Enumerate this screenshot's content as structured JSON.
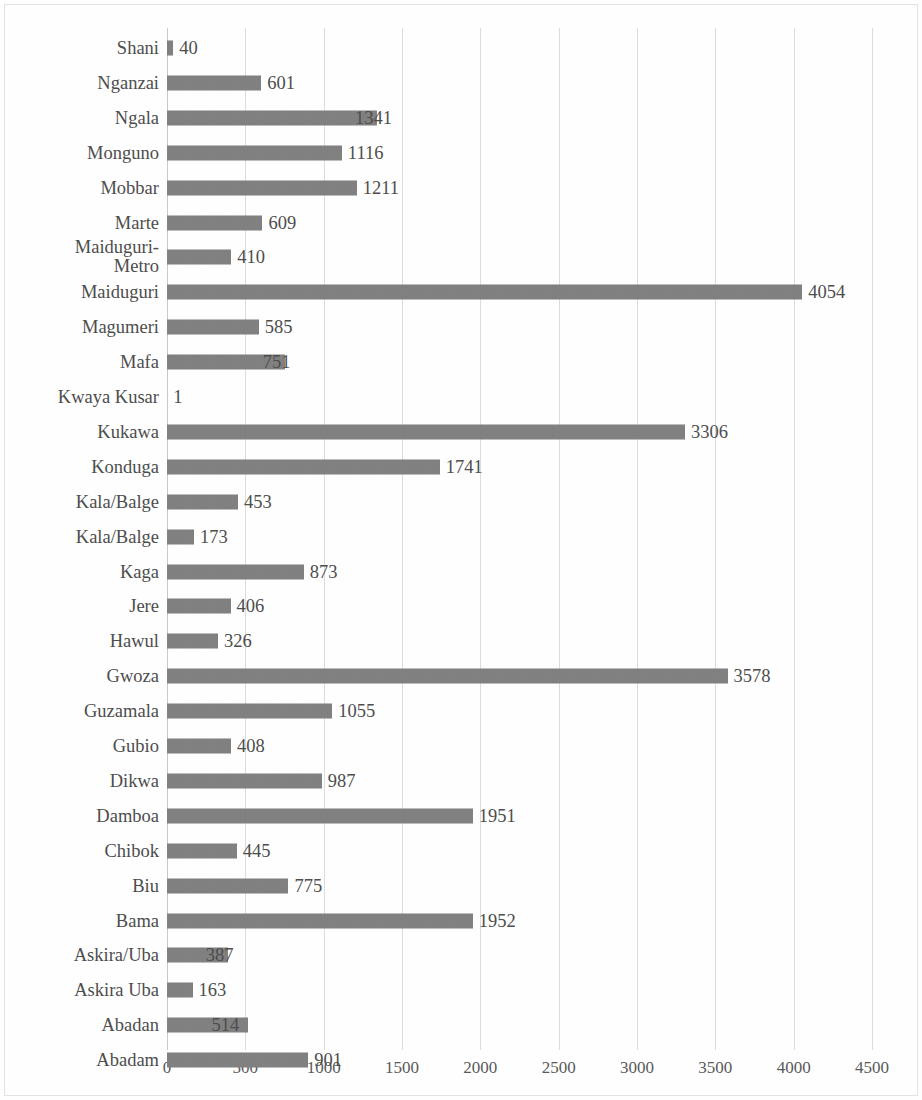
{
  "chart_data": {
    "type": "bar",
    "orientation": "horizontal",
    "title": "",
    "xlabel": "",
    "ylabel": "",
    "xlim": [
      0,
      4500
    ],
    "xticks": [
      0,
      500,
      1000,
      1500,
      2000,
      2500,
      3000,
      3500,
      4000,
      4500
    ],
    "grid": true,
    "legend": false,
    "bar_color": "#7e7e7e",
    "categories": [
      "Shani",
      "Nganzai",
      "Ngala",
      "Monguno",
      "Mobbar",
      "Marte",
      "Maiduguri-\nMetro",
      "Maiduguri",
      "Magumeri",
      "Mafa",
      "Kwaya Kusar",
      "Kukawa",
      "Konduga",
      "Kala/Balge",
      "Kala/Balge",
      "Kaga",
      "Jere",
      "Hawul",
      "Gwoza",
      "Guzamala",
      "Gubio",
      "Dikwa",
      "Damboa",
      "Chibok",
      "Biu",
      "Bama",
      "Askira/Uba",
      "Askira Uba",
      "Abadan",
      "Abadam"
    ],
    "values": [
      40,
      601,
      1341,
      1116,
      1211,
      609,
      410,
      4054,
      585,
      751,
      1,
      3306,
      1741,
      453,
      173,
      873,
      406,
      326,
      3578,
      1055,
      408,
      987,
      1951,
      445,
      775,
      1952,
      387,
      163,
      514,
      901
    ],
    "value_labels": [
      "40",
      "601",
      "1341",
      "1116",
      "1211",
      "609",
      "410",
      "4054",
      "585",
      "751",
      "1",
      "3306",
      "1741",
      "453",
      "173",
      "873",
      "406",
      "326",
      "3578",
      "1055",
      "408",
      "987",
      "1951",
      "445",
      "775",
      "1952",
      "387",
      "163",
      "514",
      "901"
    ],
    "tick_labels": [
      "0",
      "500",
      "1000",
      "1500",
      "2000",
      "2500",
      "3000",
      "3500",
      "4000",
      "4500"
    ]
  }
}
